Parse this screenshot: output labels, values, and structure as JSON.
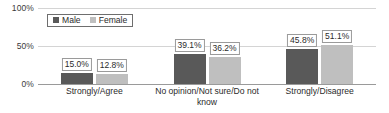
{
  "chart_data": {
    "type": "bar",
    "title": "",
    "subtitle": "",
    "xlabel": "",
    "ylabel": "",
    "ylim": [
      0,
      100
    ],
    "yticks": [
      "0%",
      "50%",
      "100%"
    ],
    "ytick_values": [
      0,
      50,
      100
    ],
    "grid": true,
    "legend_position": "top-left",
    "categories": [
      "Strongly/Agree",
      "No opinion/Not sure/Do not know",
      "Strongly/Disagree"
    ],
    "series": [
      {
        "name": "Male",
        "color": "#595959",
        "values": [
          15.0,
          39.1,
          45.8
        ],
        "labels": [
          "15.0%",
          "39.1%",
          "45.8%"
        ]
      },
      {
        "name": "Female",
        "color": "#bfbfbf",
        "values": [
          12.8,
          36.2,
          51.1
        ],
        "labels": [
          "12.8%",
          "36.2%",
          "51.1%"
        ]
      }
    ]
  },
  "legend": {
    "items": [
      {
        "label": "Male",
        "color": "#595959"
      },
      {
        "label": "Female",
        "color": "#bfbfbf"
      }
    ]
  },
  "axis": {
    "y": {
      "ticks": [
        {
          "label": "100%",
          "value": 100
        },
        {
          "label": "50%",
          "value": 50
        },
        {
          "label": "0%",
          "value": 0
        }
      ]
    }
  }
}
